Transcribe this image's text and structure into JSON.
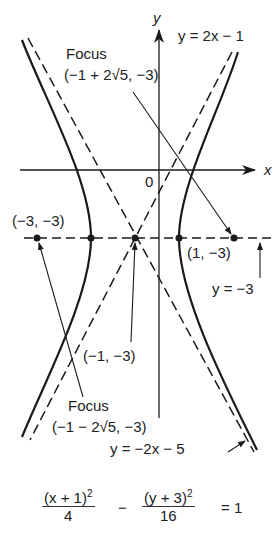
{
  "figure": {
    "type": "hyperbola-graph",
    "top_cut_text": "",
    "axes": {
      "x_label": "x",
      "y_label": "y",
      "origin_label": "0"
    },
    "equation": {
      "term1_numerator": "(x + 1)",
      "term1_exponent": "2",
      "term1_denominator": "4",
      "operator": "−",
      "term2_numerator": "(y + 3)",
      "term2_exponent": "2",
      "term2_denominator": "16",
      "rhs": "= 1"
    },
    "labels": {
      "focus_right_title": "Focus",
      "focus_right_coords": "(−1 + 2√5, −3)",
      "focus_left_title": "Focus",
      "focus_left_coords": "(−1 − 2√5, −3)",
      "vertex_left": "(−3, −3)",
      "vertex_right": "(1, −3)",
      "center": "(−1, −3)",
      "asymptote_pos": "y = 2x − 1",
      "asymptote_neg": "y = −2x − 5",
      "axis_line": "y = −3"
    },
    "points": [
      {
        "name": "focus-left",
        "x": -5.47,
        "y": -3
      },
      {
        "name": "vertex-left",
        "x": -3,
        "y": -3
      },
      {
        "name": "center",
        "x": -1,
        "y": -3
      },
      {
        "name": "vertex-right",
        "x": 1,
        "y": -3
      },
      {
        "name": "focus-right",
        "x": 3.47,
        "y": -3
      }
    ],
    "colors": {
      "ink": "#1a1a1a",
      "background": "#ffffff"
    }
  }
}
